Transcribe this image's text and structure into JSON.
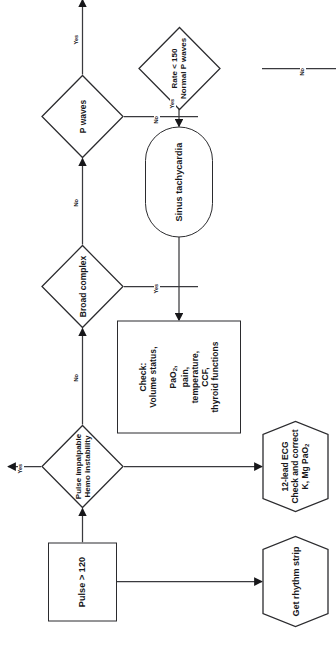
{
  "diagram": {
    "orientation": "rotated-90",
    "stroke_color": "#2b2b2e",
    "text_color": "#17171a",
    "background": "#ffffff",
    "nodes": {
      "pulse_start": {
        "shape": "rectangle",
        "label": "Pulse > 120"
      },
      "get_rhythm_strip": {
        "shape": "hexagon",
        "label": "Get rhythm strip"
      },
      "ecg_correct": {
        "shape": "hexagon",
        "line1": "12-lead ECG",
        "line2": "Check and correct",
        "line3_pre": "K, Mg PaO",
        "line3_sub": "2"
      },
      "pulse_impalpable": {
        "shape": "diamond",
        "line1": "Pulse impalpable",
        "line2": "Hemo instability"
      },
      "cardioversion": {
        "shape": "stadium",
        "label": "Cardioversion"
      },
      "broad_complex": {
        "shape": "diamond",
        "label": "Broad complex"
      },
      "p_waves": {
        "shape": "diamond",
        "label": "P waves"
      },
      "rate_normal_p": {
        "shape": "diamond",
        "line1": "Rate < 150",
        "line2": "Normal P waves"
      },
      "sinus_tachycardia": {
        "shape": "stadium",
        "label": "Sinus tachycardia"
      },
      "check_box": {
        "shape": "rectangle",
        "line1": "Check:",
        "line2": "Volume status,",
        "line3_pre": "PaO",
        "line3_sub": "2",
        "line3_post": ",",
        "line4": "pain,",
        "line5": "temperature,",
        "line6": "CCF,",
        "line7": "thyroid functions"
      }
    },
    "edges": [
      {
        "id": "e-impalpable-yes",
        "label": "Yes",
        "from": "pulse_impalpable",
        "to": "cardioversion"
      },
      {
        "id": "e-impalpable-no",
        "label": "No",
        "from": "pulse_impalpable",
        "to": "broad_complex"
      },
      {
        "id": "e-broad-yes",
        "label": "Yes",
        "from": "broad_complex",
        "to": ""
      },
      {
        "id": "e-broad-no",
        "label": "No",
        "from": "broad_complex",
        "to": "p_waves"
      },
      {
        "id": "e-pwaves-no",
        "label": "No",
        "from": "p_waves",
        "to": ""
      },
      {
        "id": "e-pwaves-yes",
        "label": "Yes",
        "from": "p_waves",
        "to": "rate_normal_p"
      },
      {
        "id": "e-rate-no",
        "label": "No",
        "from": "rate_normal_p",
        "to": ""
      },
      {
        "id": "e-rate-yes",
        "label": "Yes",
        "from": "rate_normal_p",
        "to": "sinus_tachycardia"
      }
    ]
  }
}
